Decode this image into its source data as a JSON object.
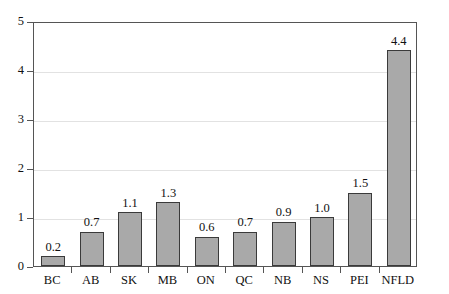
{
  "chart_data": {
    "type": "bar",
    "title": "",
    "subtitle": "",
    "xlabel": "",
    "ylabel": "",
    "categories": [
      "BC",
      "AB",
      "SK",
      "MB",
      "ON",
      "QC",
      "NB",
      "NS",
      "PEI",
      "NFLD"
    ],
    "values": [
      0.2,
      0.7,
      1.1,
      1.3,
      0.6,
      0.7,
      0.9,
      1.0,
      1.5,
      4.4
    ],
    "value_labels": [
      "0.2",
      "0.7",
      "1.1",
      "1.3",
      "0.6",
      "0.7",
      "0.9",
      "1.0",
      "1.5",
      "4.4"
    ],
    "ylim": [
      0,
      5
    ],
    "ytick_labels": [
      "0",
      "1",
      "2",
      "3",
      "4",
      "5"
    ],
    "ytick_values": [
      0,
      1,
      2,
      3,
      4,
      5
    ],
    "grid": true,
    "legend": "none",
    "bar_color": "#a9a9a9",
    "bar_border_color": "#3a3a3a",
    "grid_color": "#e2e2e2",
    "axis_color": "#555555",
    "text_color": "#111111",
    "background": "#ffffff"
  }
}
